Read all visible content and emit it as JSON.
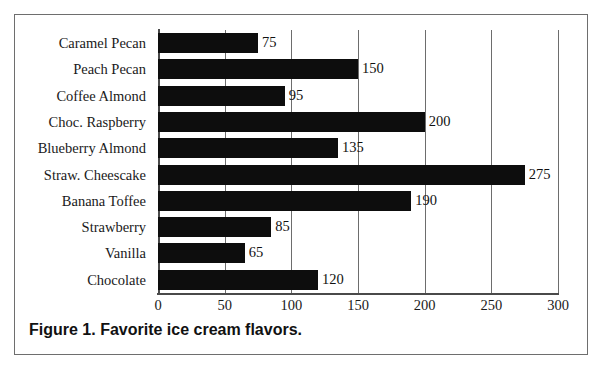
{
  "figure": {
    "caption": "Figure 1. Favorite ice cream flavors.",
    "frame_color": "#6e6e6e",
    "background": "#ffffff"
  },
  "chart_data": {
    "type": "bar",
    "orientation": "horizontal",
    "title": "Figure 1. Favorite ice cream flavors.",
    "xlabel": "",
    "ylabel": "",
    "xlim": [
      0,
      300
    ],
    "xticks": [
      0,
      50,
      100,
      150,
      200,
      250,
      300
    ],
    "xtick_labels": [
      "0",
      "50",
      "100",
      "150",
      "200",
      "250",
      "300"
    ],
    "grid": "vertical gridlines at each x tick",
    "legend": "none",
    "bar_color": "#0d0d0d",
    "data_labels": true,
    "categories": [
      "Caramel Pecan",
      "Peach Pecan",
      "Coffee Almond",
      "Choc. Raspberry",
      "Blueberry Almond",
      "Straw. Cheescake",
      "Banana Toffee",
      "Strawberry",
      "Vanilla",
      "Chocolate"
    ],
    "values": [
      75,
      150,
      95,
      200,
      135,
      275,
      190,
      85,
      65,
      120
    ],
    "value_labels": [
      "75",
      "150",
      "95",
      "200",
      "135",
      "275",
      "190",
      "85",
      "65",
      "120"
    ],
    "category_order": "top-to-bottom as listed"
  }
}
